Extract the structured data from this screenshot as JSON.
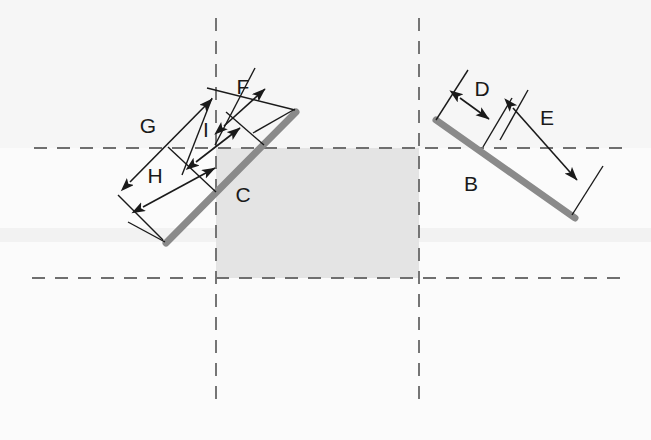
{
  "canvas": {
    "width": 651,
    "height": 440,
    "background_color": "#fbfbfb"
  },
  "colors": {
    "segment_gray": "#8a8a8a",
    "shaded_region": "#e4e4e4",
    "dashed_line": "#6f6f6f",
    "dimension_line": "#1a1a1a",
    "label_text": "#1a1a1a",
    "band_tint": "#f4f4f4"
  },
  "segments": [
    {
      "id": "segment-c",
      "label": "C",
      "label_x": 243,
      "label_y": 196,
      "x1": 166,
      "y1": 243,
      "x2": 296,
      "y2": 112,
      "thickness": 7
    },
    {
      "id": "segment-b",
      "label": "B",
      "label_x": 471,
      "label_y": 185,
      "x1": 436,
      "y1": 120,
      "x2": 575,
      "y2": 218,
      "thickness": 7
    }
  ],
  "dimensions": [
    {
      "id": "dimension-g",
      "label": "G",
      "label_x": 148,
      "label_y": 127,
      "arrow_x1": 130,
      "arrow_y1": 182,
      "arrow_x2": 212,
      "arrow_y2": 99,
      "ext1_x1": 163,
      "ext1_y1": 240,
      "ext1_x2": 118,
      "ext1_y2": 195,
      "ext2_x1": 295,
      "ext2_y1": 110,
      "ext2_x2": 207,
      "ext2_y2": 88
    },
    {
      "id": "dimension-h",
      "label": "H",
      "label_x": 155,
      "label_y": 177,
      "arrow_x1": 143,
      "arrow_y1": 207,
      "arrow_x2": 215,
      "arrow_y2": 168,
      "ext1_x1": 165,
      "ext1_y1": 242,
      "ext1_x2": 128,
      "ext1_y2": 222,
      "ext2_x1": 216,
      "ext2_y1": 192,
      "ext2_x2": 168,
      "ext2_y2": 147
    },
    {
      "id": "dimension-i",
      "label": "I",
      "label_x": 206,
      "label_y": 131,
      "arrow_x1": 196,
      "arrow_y1": 162,
      "arrow_x2": 240,
      "arrow_y2": 128,
      "ext1_x1": 212,
      "ext1_y1": 98,
      "ext1_x2": 182,
      "ext1_y2": 175,
      "ext2_x1": 264,
      "ext2_y1": 145,
      "ext2_x2": 226,
      "ext2_y2": 112
    },
    {
      "id": "dimension-f",
      "label": "F",
      "label_x": 243,
      "label_y": 88,
      "arrow_x1": 224,
      "arrow_y1": 126,
      "arrow_x2": 265,
      "arrow_y2": 89,
      "ext1_x1": 215,
      "ext1_y1": 145,
      "ext1_x2": 255,
      "ext1_y2": 68,
      "ext2_x1": 253,
      "ext2_y1": 133,
      "ext2_x2": 295,
      "ext2_y2": 109
    },
    {
      "id": "dimension-d",
      "label": "D",
      "label_x": 482,
      "label_y": 90,
      "arrow_x1": 460,
      "arrow_y1": 98,
      "arrow_x2": 489,
      "arrow_y2": 119,
      "ext1_x1": 436,
      "ext1_y1": 120,
      "ext1_x2": 468,
      "ext1_y2": 70,
      "ext2_x1": 483,
      "ext2_y1": 147,
      "ext2_x2": 512,
      "ext2_y2": 98
    },
    {
      "id": "dimension-e",
      "label": "E",
      "label_x": 547,
      "label_y": 119,
      "arrow_x1": 513,
      "arrow_y1": 108,
      "arrow_x2": 577,
      "arrow_y2": 180,
      "ext1_x1": 500,
      "ext1_y1": 140,
      "ext1_x2": 528,
      "ext1_y2": 90,
      "ext2_x1": 572,
      "ext2_y1": 215,
      "ext2_x2": 603,
      "ext2_y2": 166
    }
  ],
  "guides": {
    "horizontal": [
      {
        "id": "h-guide-upper",
        "x1": 34,
        "y1": 148,
        "x2": 626,
        "y2": 148
      },
      {
        "id": "h-guide-lower",
        "x1": 32,
        "y1": 278,
        "x2": 627,
        "y2": 278
      }
    ],
    "vertical": [
      {
        "id": "v-guide-left",
        "x1": 216,
        "y1": 18,
        "x2": 216,
        "y2": 400
      },
      {
        "id": "v-guide-right",
        "x1": 419,
        "y1": 18,
        "x2": 419,
        "y2": 400
      }
    ]
  },
  "shaded_region": {
    "id": "shaded-rectangle",
    "x": 216,
    "y": 148,
    "width": 203,
    "height": 130
  },
  "bands": [
    {
      "id": "band-upper",
      "x": 0,
      "y": 0,
      "width": 651,
      "height": 148
    },
    {
      "id": "band-middle",
      "x": 0,
      "y": 228,
      "width": 651,
      "height": 14
    }
  ]
}
